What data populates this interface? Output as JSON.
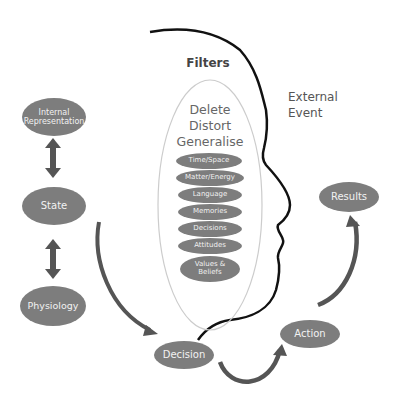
{
  "diagram": {
    "filters_title": "Filters",
    "filter_processes": [
      "Delete",
      "Distort",
      "Generalise"
    ],
    "filter_items": [
      "Time/Space",
      "Matter/Energy",
      "Language",
      "Memories",
      "Decisions",
      "Attitudes",
      "Values & Beliefs"
    ],
    "external_event": [
      "External",
      "Event"
    ],
    "nodes": {
      "internal_representation": "Internal Representation",
      "state": "State",
      "physiology": "Physiology",
      "decision": "Decision",
      "action": "Action",
      "results": "Results"
    },
    "colors": {
      "node_fill": "#7d7d7d",
      "node_text": "#f2f2f2",
      "arrow": "#555555",
      "head_outline": "#111111",
      "filter_outline": "#cccccc",
      "label_text": "#555555"
    }
  }
}
